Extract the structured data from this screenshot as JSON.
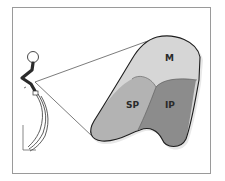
{
  "figure": {
    "frame_color": "#9a9a9a",
    "background": "#ffffff",
    "regions": [
      {
        "id": "M",
        "label": "M",
        "fill": "#d6d6d6"
      },
      {
        "id": "SP",
        "label": "SP",
        "fill": "#b3b3b3"
      },
      {
        "id": "IP",
        "label": "IP",
        "fill": "#8c8c8c"
      }
    ],
    "outline_color": "#1e1e1e",
    "callout_line_color": "#444444",
    "figure_icon": "human-figure-side-view"
  }
}
